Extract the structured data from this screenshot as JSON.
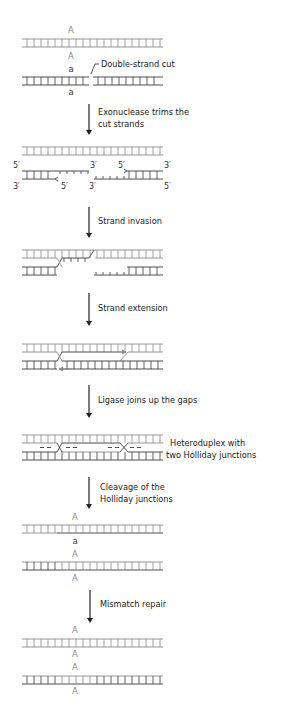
{
  "colors": {
    "strand_A": "#8a8a8a",
    "strand_a": "#3a3a3a",
    "arrow": "#222222",
    "text": "#222222"
  },
  "steps": [
    {
      "id": "initial",
      "alleles_top_duplex": "A",
      "alleles_bottom_duplex": [
        "A",
        "a",
        "a"
      ]
    },
    {
      "id": "cut",
      "label": "Double-strand cut"
    },
    {
      "id": "exonuclease",
      "label_lines": [
        "Exonuclease trims the",
        "cut strands"
      ]
    },
    {
      "id": "invasion",
      "label": "Strand invasion"
    },
    {
      "id": "extension",
      "label": "Strand extension"
    },
    {
      "id": "ligase",
      "label": "Ligase joins up the gaps"
    },
    {
      "id": "heteroduplex",
      "label_lines": [
        "Heteroduplex with",
        "two Holliday junctions"
      ]
    },
    {
      "id": "cleavage",
      "label_lines": [
        "Cleavage of the",
        "Holliday junctions"
      ]
    },
    {
      "id": "mismatch",
      "label": "Mismatch repair"
    }
  ],
  "labels": {
    "allele_A": "A",
    "allele_a": "a",
    "five_prime": "5′",
    "three_prime": "3′",
    "double_strand_cut": "Double-strand cut",
    "exonuclease_1": "Exonuclease trims the",
    "exonuclease_2": "cut strands",
    "strand_invasion": "Strand invasion",
    "strand_extension": "Strand extension",
    "ligase": "Ligase joins up the gaps",
    "heteroduplex_1": "Heteroduplex with",
    "heteroduplex_2": "two Holliday junctions",
    "cleavage_1": "Cleavage of the",
    "cleavage_2": "Holliday junctions",
    "mismatch_repair": "Mismatch repair"
  }
}
